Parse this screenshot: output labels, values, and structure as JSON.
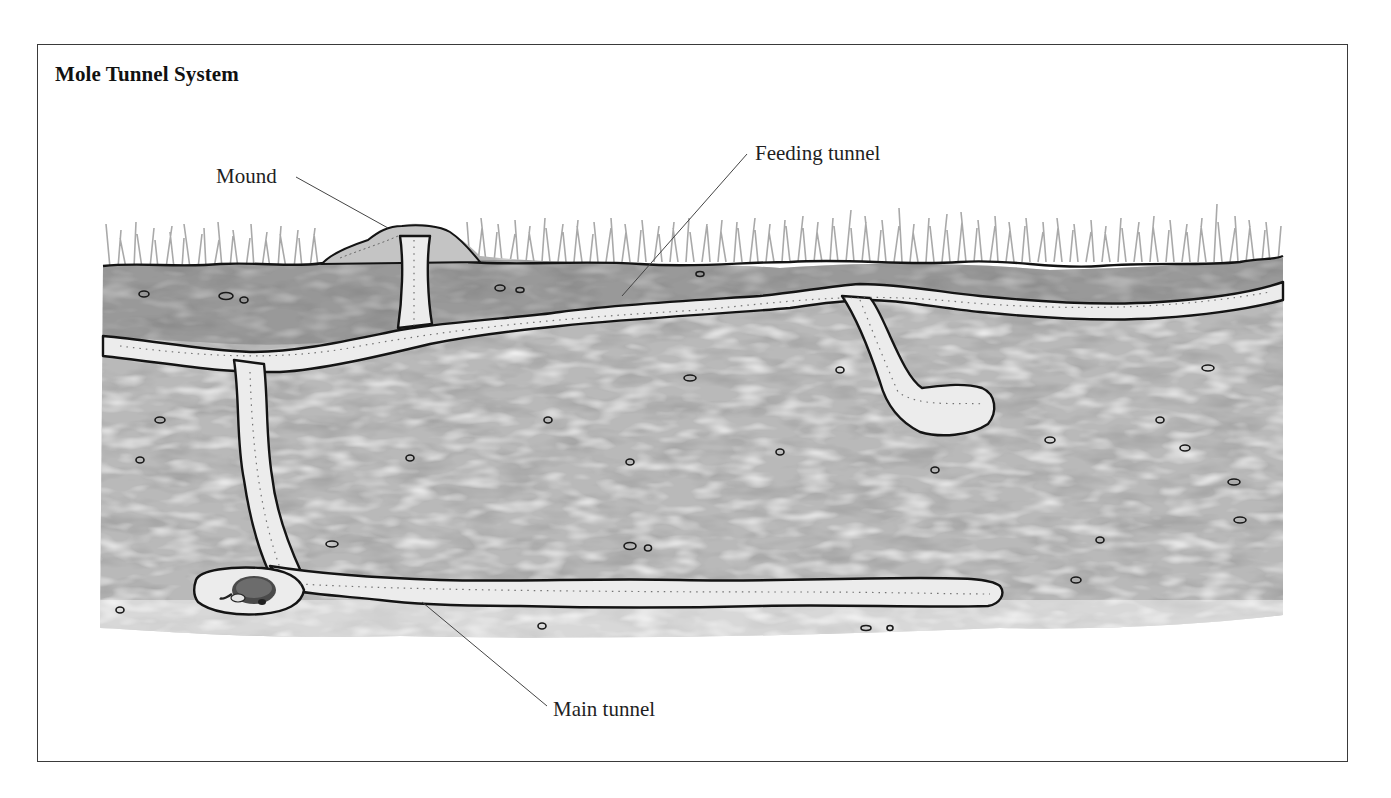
{
  "figure": {
    "title": "Mole Tunnel System",
    "labels": {
      "mound": "Mound",
      "feeding_tunnel": "Feeding tunnel",
      "main_tunnel": "Main tunnel"
    },
    "illustration": {
      "subject": "cross-section of soil showing mole burrow",
      "elements": [
        "grass",
        "soil-surface",
        "mound",
        "feeding-tunnel",
        "vertical-shaft",
        "nest-chamber",
        "mole",
        "main-tunnel",
        "side-chamber",
        "pebbles"
      ],
      "palette": {
        "soil_dark": "#6e6e6e",
        "soil_mid": "#a3a3a3",
        "soil_light": "#cfcfcf",
        "tunnel": "#ececec",
        "outline": "#141414",
        "grass": "#9a9a9a",
        "frame": "#3a3a3a"
      }
    }
  }
}
